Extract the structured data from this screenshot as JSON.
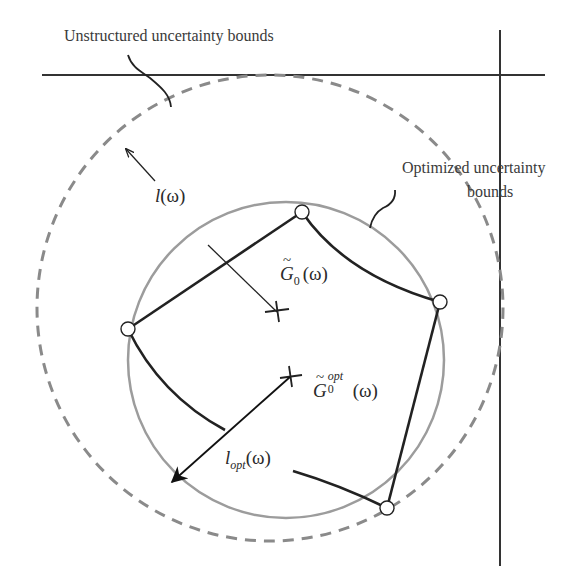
{
  "diagram": {
    "labels": {
      "unstructured": "Unstructured uncertainty bounds",
      "optimized_line1": "Optimized uncertainty",
      "optimized_line2": "bounds",
      "radius_unstructured": {
        "symbol": "l",
        "arg": "(ω)"
      },
      "center_nominal": {
        "symbol": "G",
        "sub": "0",
        "arg": "(ω)"
      },
      "center_optimal": {
        "symbol": "G",
        "sub": "0",
        "sup": "opt",
        "arg": "(ω)"
      },
      "radius_optimal": {
        "symbol": "l",
        "sub": "opt",
        "arg": "(ω)"
      }
    },
    "elements": {
      "axes": {
        "horizontal_y": 75,
        "vertical_x": 500,
        "color": "#333333"
      },
      "unstructured_circle": {
        "cx": 270,
        "cy": 308,
        "r": 233,
        "style": "dashed",
        "color": "#8a8a8a"
      },
      "optimized_circle": {
        "cx": 286,
        "cy": 360,
        "r": 158,
        "style": "solid",
        "color": "#9a9a9a"
      },
      "nominal_center": {
        "x": 277,
        "y": 312
      },
      "optimal_center": {
        "x": 290,
        "y": 377
      },
      "vertices": [
        {
          "x": 302,
          "y": 212
        },
        {
          "x": 440,
          "y": 302
        },
        {
          "x": 387,
          "y": 508
        },
        {
          "x": 128,
          "y": 329
        }
      ],
      "boundary_color": "#222222"
    }
  }
}
